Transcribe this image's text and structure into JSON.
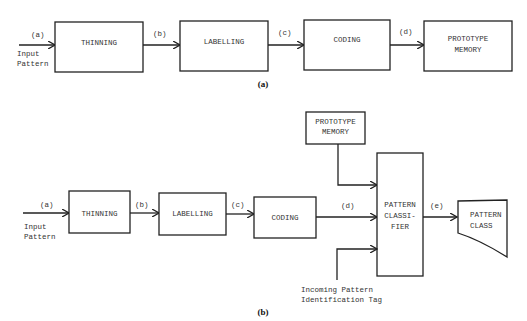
{
  "diagram_a": {
    "caption": "(a)",
    "input_label_1": "Input",
    "input_label_2": "Pattern",
    "edges": [
      "(a)",
      "(b)",
      "(c)",
      "(d)"
    ],
    "blocks": {
      "thinning": "THINNING",
      "labelling": "LABELLING",
      "coding": "CODING",
      "prototype_memory_1": "PROTOTYPE",
      "prototype_memory_2": "MEMORY"
    }
  },
  "diagram_b": {
    "caption": "(b)",
    "input_label_1": "Input",
    "input_label_2": "Pattern",
    "edges": [
      "(a)",
      "(b)",
      "(c)",
      "(d)",
      "(e)"
    ],
    "blocks": {
      "thinning": "THINNING",
      "labelling": "LABELLING",
      "coding": "CODING",
      "prototype_memory_1": "PROTOTYPE",
      "prototype_memory_2": "MEMORY",
      "classifier_1": "PATTERN",
      "classifier_2": "CLASSI-",
      "classifier_3": "FIER",
      "pattern_class_1": "PATTERN",
      "pattern_class_2": "CLASS"
    },
    "tag_label_1": "Incoming Pattern",
    "tag_label_2": "Identification Tag"
  }
}
